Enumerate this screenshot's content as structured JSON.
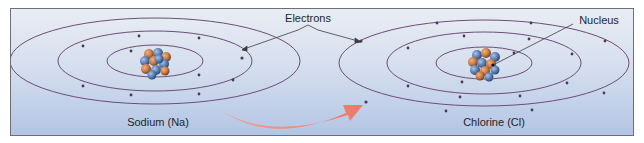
{
  "diagram": {
    "labels": {
      "electrons": "Electrons",
      "nucleus": "Nucleus",
      "sodium": "Sodium (Na)",
      "chlorine": "Chlorine (Cl)"
    },
    "atoms": [
      {
        "name": "Sodium (Na)",
        "shells": [
          2,
          8,
          0
        ],
        "center": [
          144,
          56
        ]
      },
      {
        "name": "Chlorine (Cl)",
        "shells": [
          2,
          8,
          7
        ],
        "incoming_electrons": 1,
        "center": [
          471,
          56
        ]
      }
    ],
    "colors": {
      "orbit": "#6a4f77",
      "electron": "#4a3a55",
      "arrow": "#ee7d66",
      "proton": "#c97a45",
      "neutron": "#5a7fb4",
      "background_top": "#e9edf4",
      "background_bottom": "#b3c5e4",
      "border": "#6d6f75"
    },
    "transfer_arrow": {
      "from": "Sodium (Na)",
      "to": "Chlorine (Cl)"
    }
  }
}
